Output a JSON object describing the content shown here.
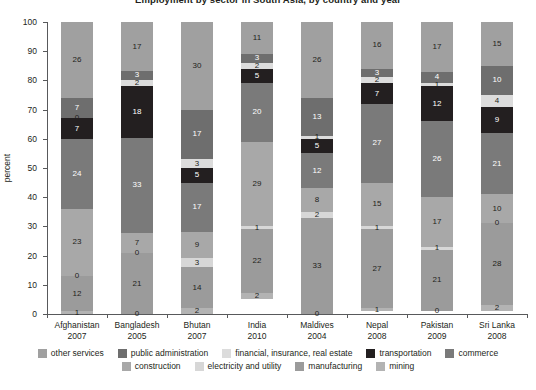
{
  "chart_data": {
    "type": "bar",
    "subtype": "stacked-bar-100-percent",
    "title": "Employment by sector in South Asia, by country and year",
    "ylabel": "percent",
    "xlabel": "",
    "ylim": [
      0,
      100
    ],
    "yticks": [
      0,
      10,
      20,
      30,
      40,
      50,
      60,
      70,
      80,
      90,
      100
    ],
    "grid": false,
    "legend_position": "bottom",
    "categories": [
      "Afghanistan",
      "Bangladesh",
      "Bhutan",
      "India",
      "Maldives",
      "Nepal",
      "Pakistan",
      "Sri Lanka"
    ],
    "category_years": [
      "2007",
      "2005",
      "2007",
      "2010",
      "2004",
      "2008",
      "2009",
      "2008"
    ],
    "series": [
      {
        "name": "mining",
        "color": "#b3b3b3",
        "values": [
          1,
          0,
          2,
          2,
          0,
          1,
          0,
          2
        ]
      },
      {
        "name": "manufacturing",
        "color": "#9b9b9b",
        "values": [
          12,
          21,
          14,
          22,
          33,
          27,
          21,
          28
        ]
      },
      {
        "name": "electricity and utility",
        "color": "#d7d7d7",
        "values": [
          0,
          0,
          3,
          1,
          2,
          1,
          1,
          0
        ]
      },
      {
        "name": "construction",
        "color": "#a8a8a8",
        "values": [
          23,
          7,
          9,
          29,
          8,
          15,
          17,
          10
        ]
      },
      {
        "name": "commerce",
        "color": "#7a7a7a",
        "values": [
          24,
          33,
          17,
          20,
          12,
          27,
          26,
          21
        ]
      },
      {
        "name": "transportation",
        "color": "#231f20",
        "values": [
          7,
          18,
          5,
          5,
          5,
          7,
          12,
          9
        ]
      },
      {
        "name": "financial, insurance, real estate",
        "color": "#dcdcdc",
        "values": [
          0,
          2,
          3,
          2,
          1,
          2,
          1,
          4
        ]
      },
      {
        "name": "public administration",
        "color": "#6e6e6e",
        "values": [
          7,
          3,
          17,
          3,
          13,
          3,
          4,
          10
        ]
      },
      {
        "name": "other services",
        "color": "#a0a0a0",
        "values": [
          26,
          17,
          30,
          11,
          26,
          16,
          17,
          15
        ]
      }
    ],
    "legend_row_1": [
      "other services",
      "public administration",
      "financial, insurance, real estate",
      "transportation",
      "commerce"
    ],
    "legend_row_2": [
      "construction",
      "electricity and utility",
      "manufacturing",
      "mining"
    ]
  }
}
